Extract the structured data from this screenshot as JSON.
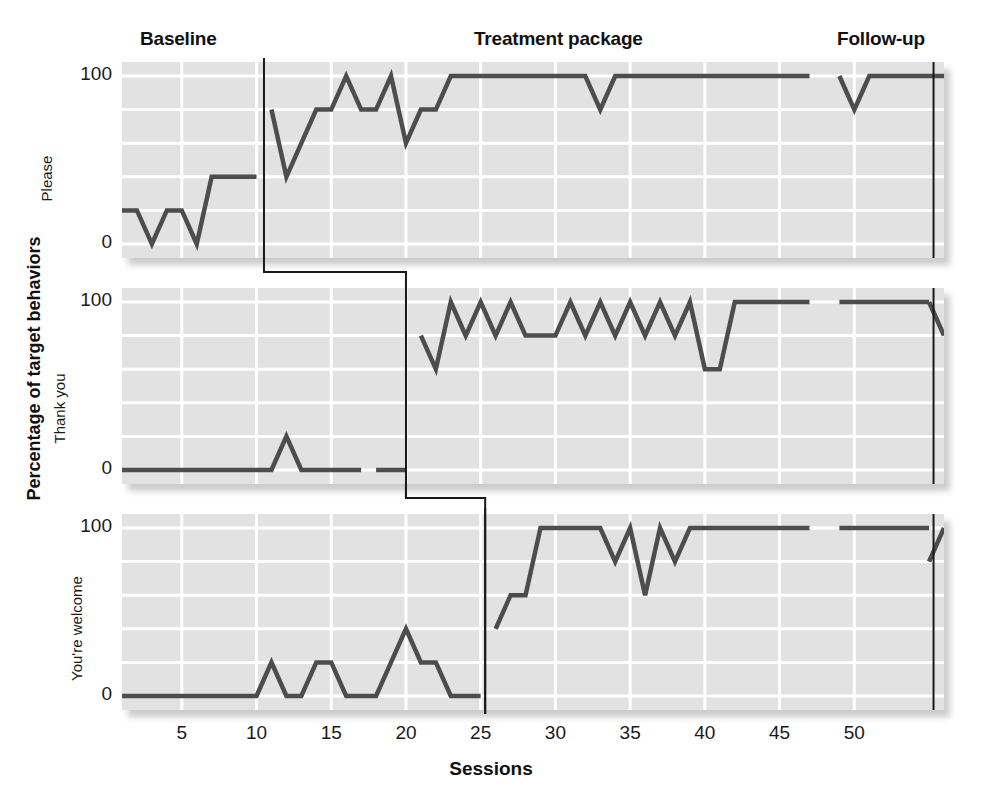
{
  "figure": {
    "xlabel": "Sessions",
    "ylabel": "Percentage of target behaviors"
  },
  "phases": {
    "baseline": "Baseline",
    "treatment": "Treatment package",
    "followup": "Follow-up"
  },
  "axis": {
    "y_ticks": [
      "0",
      "100"
    ],
    "x_ticks": [
      "5",
      "10",
      "15",
      "20",
      "25",
      "30",
      "35",
      "40",
      "45",
      "50"
    ]
  },
  "colors": {
    "plot_background": "#e2e2e2",
    "gridline": "#ffffff",
    "data_line": "#4d4d4d",
    "phase_line": "#1a1a1a",
    "text": "#1a1a1a"
  },
  "chart_data": {
    "type": "line",
    "title": "",
    "subtitle": "",
    "xlabel": "Sessions",
    "ylabel": "Percentage of target behaviors",
    "xlim": [
      1,
      56
    ],
    "ylim": [
      0,
      100
    ],
    "y_ticks": [
      0,
      20,
      40,
      60,
      80,
      100
    ],
    "y_tick_labels_shown": [
      0,
      100
    ],
    "x_ticks": [
      5,
      10,
      15,
      20,
      25,
      30,
      35,
      40,
      45,
      50
    ],
    "grid": true,
    "legend": "none",
    "design": "multiple-baseline across behaviors",
    "phase_labels": [
      "Baseline",
      "Treatment package",
      "Follow-up"
    ],
    "followup_line_x": 55.3,
    "panels": [
      {
        "name": "Please",
        "intervention_x": 10.5,
        "phases": [
          {
            "phase": "Baseline",
            "x": [
              1,
              2,
              3,
              4,
              5,
              6,
              7,
              8,
              9,
              10
            ],
            "y": [
              20,
              20,
              0,
              20,
              20,
              0,
              40,
              40,
              40,
              40
            ]
          },
          {
            "phase": "Treatment package",
            "x": [
              11,
              12,
              13,
              14,
              15,
              16,
              17,
              18,
              19,
              20,
              21,
              22,
              23,
              24,
              25,
              26,
              27,
              28,
              29,
              30,
              31,
              32,
              33,
              34,
              35,
              36,
              37,
              38,
              39,
              40,
              41,
              42,
              43,
              44,
              45,
              46,
              47
            ],
            "y": [
              80,
              40,
              60,
              80,
              80,
              100,
              80,
              80,
              100,
              60,
              80,
              80,
              100,
              100,
              100,
              100,
              100,
              100,
              100,
              100,
              100,
              100,
              80,
              100,
              100,
              100,
              100,
              100,
              100,
              100,
              100,
              100,
              100,
              100,
              100,
              100,
              100
            ]
          },
          {
            "phase": "Treatment package (post-break)",
            "x": [
              49,
              50,
              51,
              52,
              53,
              54,
              55
            ],
            "y": [
              100,
              80,
              100,
              100,
              100,
              100,
              100
            ]
          },
          {
            "phase": "Follow-up",
            "x": [
              55,
              56
            ],
            "y": [
              100,
              100
            ]
          }
        ]
      },
      {
        "name": "Thank you",
        "intervention_x": 20.0,
        "phases": [
          {
            "phase": "Baseline",
            "x": [
              1,
              2,
              3,
              4,
              5,
              6,
              7,
              8,
              9,
              10,
              11,
              12,
              13,
              14,
              15,
              16,
              17
            ],
            "y": [
              0,
              0,
              0,
              0,
              0,
              0,
              0,
              0,
              0,
              0,
              0,
              20,
              0,
              0,
              0,
              0,
              0
            ]
          },
          {
            "phase": "Baseline (post-break)",
            "x": [
              18,
              19,
              20
            ],
            "y": [
              0,
              0,
              0
            ]
          },
          {
            "phase": "Treatment package",
            "x": [
              21,
              22,
              23,
              24,
              25,
              26,
              27,
              28,
              29,
              30,
              31,
              32,
              33,
              34,
              35,
              36,
              37,
              38,
              39,
              40,
              41,
              42,
              43,
              44,
              45,
              46,
              47
            ],
            "y": [
              80,
              60,
              100,
              80,
              100,
              80,
              100,
              80,
              80,
              80,
              100,
              80,
              100,
              80,
              100,
              80,
              100,
              80,
              100,
              60,
              60,
              100,
              100,
              100,
              100,
              100,
              100
            ]
          },
          {
            "phase": "Treatment package (post-break)",
            "x": [
              49,
              50,
              51,
              52,
              53,
              54,
              55
            ],
            "y": [
              100,
              100,
              100,
              100,
              100,
              100,
              100
            ]
          },
          {
            "phase": "Follow-up",
            "x": [
              55,
              56
            ],
            "y": [
              100,
              80
            ]
          }
        ]
      },
      {
        "name": "You're welcome",
        "intervention_x": 25.3,
        "phases": [
          {
            "phase": "Baseline",
            "x": [
              1,
              2,
              3,
              4,
              5,
              6,
              7,
              8,
              9,
              10,
              11,
              12,
              13,
              14,
              15,
              16,
              17,
              18,
              19,
              20,
              21,
              22,
              23,
              24,
              25
            ],
            "y": [
              0,
              0,
              0,
              0,
              0,
              0,
              0,
              0,
              0,
              0,
              20,
              0,
              0,
              20,
              20,
              0,
              0,
              0,
              20,
              40,
              20,
              20,
              0,
              0,
              0
            ]
          },
          {
            "phase": "Treatment package",
            "x": [
              26,
              27,
              28,
              29,
              30,
              31,
              32,
              33,
              34,
              35,
              36,
              37,
              38,
              39,
              40,
              41,
              42,
              43,
              44,
              45,
              46,
              47
            ],
            "y": [
              40,
              60,
              60,
              100,
              100,
              100,
              100,
              100,
              80,
              100,
              60,
              100,
              80,
              100,
              100,
              100,
              100,
              100,
              100,
              100,
              100,
              100
            ]
          },
          {
            "phase": "Treatment package (post-break)",
            "x": [
              49,
              50,
              51,
              52,
              53,
              54,
              55
            ],
            "y": [
              100,
              100,
              100,
              100,
              100,
              100,
              100
            ]
          },
          {
            "phase": "Follow-up",
            "x": [
              55,
              56
            ],
            "y": [
              80,
              100,
              80
            ]
          }
        ]
      }
    ]
  }
}
